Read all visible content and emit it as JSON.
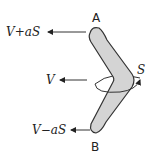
{
  "diagram": {
    "points": {
      "top": "A",
      "bottom": "B"
    },
    "velocities": {
      "top": "V+aS",
      "middle": "V",
      "bottom": "V−aS"
    },
    "spin_label": "S",
    "colors": {
      "fill": "#d4d4d4",
      "stroke": "#333333",
      "text": "#222222"
    }
  }
}
